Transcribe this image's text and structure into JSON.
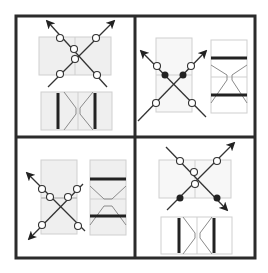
{
  "figure": {
    "layout": "2x2 grid of panels",
    "colors": {
      "frame": "#2b2b2b",
      "rect_fill": "#efefef",
      "rect_stroke": "#c8c8c8",
      "line": "#333333",
      "inset_curve": "#8a8a8a",
      "thick_bar": "#222222",
      "dot_open_fill": "#ffffff",
      "dot_filled": "#222222"
    },
    "panels": [
      {
        "id": "top-left",
        "description": "two crossing arrows pointing up, open dots, with vertical-bar inset below"
      },
      {
        "id": "top-right",
        "description": "two crossing arrows pointing up-left/up-right, two filled dots, with horizontal-bar inset to the right"
      },
      {
        "id": "bottom-left",
        "description": "two crossing arrows pointing left, open dots, with horizontal-bar inset to the right"
      },
      {
        "id": "bottom-right",
        "description": "two crossing arrows pointing right, two filled dots, with vertical-bar inset below"
      }
    ]
  }
}
